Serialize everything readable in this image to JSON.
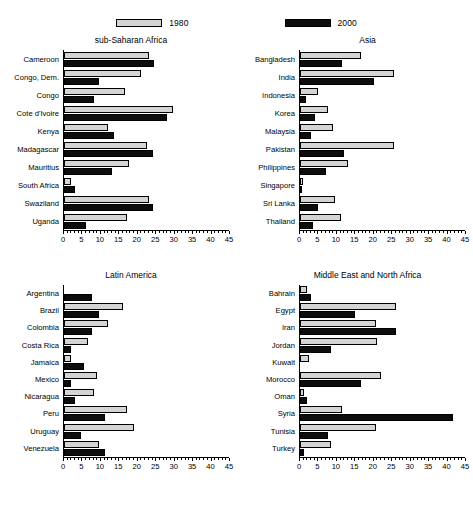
{
  "legend": {
    "entries": [
      {
        "label": "1980",
        "color": "#d4d4d4",
        "swatch_name": "legend-swatch-1980"
      },
      {
        "label": "2000",
        "color": "#0d0d0d",
        "swatch_name": "legend-swatch-2000"
      }
    ]
  },
  "chart_data": {
    "type": "bar",
    "orientation": "horizontal",
    "title": "",
    "xlabel": "",
    "ylabel": "",
    "xlim": [
      0,
      45
    ],
    "xticks": [
      0,
      5,
      10,
      15,
      20,
      25,
      30,
      35,
      40,
      45
    ],
    "minor_tick_step": 1,
    "grid": false,
    "legend_position": "top-center",
    "series_names": [
      "1980",
      "2000"
    ],
    "series_colors": [
      "#d4d4d4",
      "#0d0d0d"
    ],
    "panels": [
      {
        "title": "sub-Saharan Africa",
        "categories": [
          "Cameroon",
          "Congo, Dem.",
          "Congo",
          "Cote d'Ivoire",
          "Kenya",
          "Madagascar",
          "Mauritius",
          "South Africa",
          "Swaziland",
          "Uganda"
        ],
        "series": [
          {
            "name": "1980",
            "values": [
              23.0,
              21.0,
              16.5,
              29.5,
              12.0,
              22.5,
              17.5,
              2.0,
              23.0,
              17.0
            ]
          },
          {
            "name": "2000",
            "values": [
              24.5,
              9.5,
              8.0,
              28.0,
              13.5,
              24.0,
              13.0,
              3.0,
              24.0,
              6.0
            ]
          }
        ]
      },
      {
        "title": "Asia",
        "categories": [
          "Bangladesh",
          "India",
          "Indonesia",
          "Korea",
          "Malaysia",
          "Pakistan",
          "Philippines",
          "Singapore",
          "Sri Lanka",
          "Thailand"
        ],
        "series": [
          {
            "name": "1980",
            "values": [
              16.5,
              25.5,
              5.0,
              7.5,
              9.0,
              25.5,
              13.0,
              0.8,
              9.5,
              11.0
            ]
          },
          {
            "name": "2000",
            "values": [
              11.5,
              20.0,
              1.5,
              4.0,
              3.0,
              12.0,
              7.0,
              0.3,
              5.0,
              3.5
            ]
          }
        ]
      },
      {
        "title": "Latin America",
        "categories": [
          "Argentina",
          "Brazil",
          "Colombia",
          "Costa Rica",
          "Jamaica",
          "Mexico",
          "Nicaragua",
          "Peru",
          "Uruguay",
          "Venezuela"
        ],
        "series": [
          {
            "name": "1980",
            "values": [
              0,
              16.0,
              12.0,
              6.5,
              2.0,
              9.0,
              8.0,
              17.0,
              19.0,
              9.5
            ]
          },
          {
            "name": "2000",
            "values": [
              7.5,
              9.5,
              7.5,
              2.0,
              5.5,
              2.0,
              3.0,
              11.0,
              4.5,
              11.0
            ]
          }
        ]
      },
      {
        "title": "Middle East and North Africa",
        "categories": [
          "Bahrain",
          "Egypt",
          "Iran",
          "Jordan",
          "Kuwait",
          "Morocco",
          "Oman",
          "Syria",
          "Tunisia",
          "Turkey"
        ],
        "series": [
          {
            "name": "1980",
            "values": [
              1.8,
              26.0,
              20.5,
              21.0,
              2.5,
              22.0,
              1.0,
              11.5,
              20.5,
              8.5
            ]
          },
          {
            "name": "2000",
            "values": [
              3.0,
              15.0,
              26.0,
              8.5,
              0,
              16.5,
              2.0,
              41.5,
              7.5,
              1.0
            ]
          }
        ]
      }
    ]
  }
}
